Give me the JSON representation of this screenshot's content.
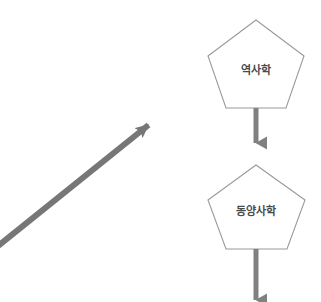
{
  "canvas": {
    "width": 321,
    "height": 302,
    "background": "#ffffff"
  },
  "colors": {
    "node_stroke": "#9a9a9a",
    "node_fill": "#ffffff",
    "arrow_gray": "#808080",
    "diagonal_arrow": "#777777",
    "label_text": "#4a4a4a"
  },
  "diagram": {
    "type": "flow-diagram",
    "nodes": [
      {
        "id": "node-historiography",
        "label": "역사학",
        "shape": "pentagon",
        "center_x": 256,
        "center_y": 68,
        "width": 96,
        "height": 88
      },
      {
        "id": "node-east-asian-history",
        "label": "동양사학",
        "shape": "pentagon",
        "center_x": 256,
        "center_y": 212,
        "width": 97,
        "height": 84
      }
    ],
    "connectors": [
      {
        "id": "arrow-historiography-to-east-asian",
        "kind": "vertical-arrow",
        "from": "node-historiography",
        "to": "node-east-asian-history",
        "x": 256,
        "y_start": 108,
        "y_end": 143
      },
      {
        "id": "arrow-east-asian-down",
        "kind": "vertical-arrow",
        "from": "node-east-asian-history",
        "to": null,
        "x": 256,
        "y_start": 249,
        "y_end": 300
      },
      {
        "id": "arrow-diagonal-ascending",
        "kind": "diagonal-arrow",
        "from": null,
        "to": null,
        "x_start": -12,
        "y_start": 254,
        "x_end": 157,
        "y_end": 118
      }
    ]
  }
}
